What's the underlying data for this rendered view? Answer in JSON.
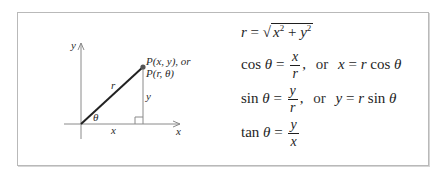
{
  "diagram": {
    "axes": {
      "x_label": "x",
      "y_label": "y"
    },
    "point_label_line1": "P(x, y), or",
    "point_label_line2": "P(r, θ)",
    "hypotenuse_label": "r",
    "vertical_leg_label": "y",
    "horizontal_leg_label": "x",
    "angle_label": "θ"
  },
  "formulas": {
    "r_eq": {
      "lhs": "r",
      "eq": "=",
      "sqrt_sym": "√",
      "x_term": "x",
      "exp1": "2",
      "plus": "+",
      "y_term": "y",
      "exp2": "2"
    },
    "cos": {
      "fn": "cos",
      "theta": "θ",
      "eq": "=",
      "num": "x",
      "den": "r",
      "comma": ",",
      "or": "or",
      "rhs_var": "x",
      "rhs_eq": "=",
      "rhs_r": "r",
      "rhs_fn": "cos",
      "rhs_theta": "θ"
    },
    "sin": {
      "fn": "sin",
      "theta": "θ",
      "eq": "=",
      "num": "y",
      "den": "r",
      "comma": ",",
      "or": "or",
      "rhs_var": "y",
      "rhs_eq": "=",
      "rhs_r": "r",
      "rhs_fn": "sin",
      "rhs_theta": "θ"
    },
    "tan": {
      "fn": "tan",
      "theta": "θ",
      "eq": "=",
      "num": "y",
      "den": "x"
    }
  }
}
